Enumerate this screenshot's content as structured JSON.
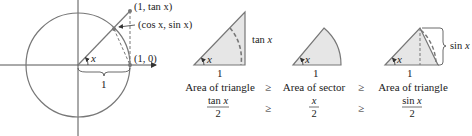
{
  "unit_circle": {
    "point_tan_label": "(1, tan x)",
    "point_cos_sin_label": "(cos x, sin x)",
    "point_one_zero_label": "(1, 0)",
    "angle_label": "x",
    "radius_label": "1"
  },
  "panels": [
    {
      "shape": "triangle-large",
      "angle_label": "x",
      "base_label": "1",
      "side_label": "tan x",
      "caption": "Area of triangle",
      "formula_numerator": "tan x",
      "formula_denominator": "2"
    },
    {
      "shape": "sector",
      "angle_label": "x",
      "base_label": "1",
      "caption": "Area of sector",
      "formula_numerator": "x",
      "formula_denominator": "2"
    },
    {
      "shape": "triangle-small",
      "angle_label": "x",
      "base_label": "1",
      "side_label": "sin x",
      "caption": "Area of triangle",
      "formula_numerator": "sin x",
      "formula_denominator": "2"
    }
  ],
  "comparators": [
    "≥",
    "≥"
  ],
  "colors": {
    "stroke": "#777777",
    "fill": "#e6e6e6",
    "text": "#222222"
  }
}
